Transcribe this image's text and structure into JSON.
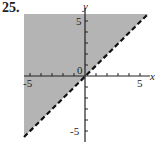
{
  "problem": {
    "number": "25."
  },
  "graph": {
    "type": "inequality-region",
    "boundary": "y = x",
    "boundary_style": "dashed",
    "shaded_side": "above",
    "x_axis_label": "x",
    "y_axis_label": "y",
    "origin_label": "0",
    "x_ticks": {
      "neg": "-5",
      "pos": "5"
    },
    "y_ticks": {
      "neg": "-5",
      "pos": "5"
    },
    "range": {
      "xmin": -5.5,
      "xmax": 5.5,
      "ymin": -5.5,
      "ymax": 5.5
    },
    "colors": {
      "shade": "#b4b4b4",
      "axis": "#222222",
      "line": "#111111"
    }
  }
}
